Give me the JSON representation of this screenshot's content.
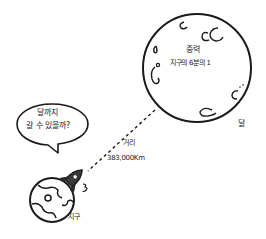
{
  "moon": {
    "title": "중력",
    "subtitle": "지구의 6분의 1",
    "label": "달"
  },
  "speech_bubble": {
    "line1": "달까지",
    "line2": "갈 수 있을까?"
  },
  "distance": {
    "label": "거리",
    "value": "383,000Km"
  },
  "earth": {
    "label": "지구"
  },
  "colors": {
    "stroke": "#1a1a1a",
    "rocket_fill": "#3a3a3a",
    "background": "#ffffff"
  }
}
